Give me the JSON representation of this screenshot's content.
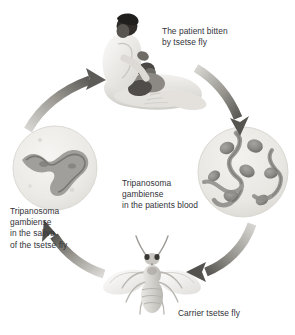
{
  "figure": {
    "background_color": "#ffffff",
    "text_color": "#33343a",
    "cycle_direction": "counter-clockwise"
  },
  "labels": {
    "patient": "The patient bitten\nby tsetse fly",
    "blood": "Tripanosoma\ngambiense\nin the patients blood",
    "saliva": "Tripanosoma\ngambiense\nin the saliva\nof the tsetse fly",
    "fly": "Carrier tsetse fly"
  },
  "nodes": [
    {
      "id": "patient",
      "name": "patient-illustration",
      "description": "Doctor in white coat leaning over a patient lying in bed",
      "position": "top-center"
    },
    {
      "id": "blood-circle",
      "name": "blood-smear-circle",
      "description": "Round microscope field of patient blood with red blood cells and trypanosomes",
      "position": "right",
      "blood_cell_count": 7,
      "circle_fill": "#eceae6",
      "cell_color": "#8a8a8a"
    },
    {
      "id": "fly",
      "name": "tsetse-fly-illustration",
      "description": "Top-down view of a carrier tsetse fly with spread wings",
      "position": "bottom-center"
    },
    {
      "id": "saliva-circle",
      "name": "saliva-smear-circle",
      "description": "Round microscope field of tsetse fly saliva with a single trypanosome",
      "position": "left",
      "parasite_count": 1,
      "circle_fill": "#ededea",
      "parasite_color": "#8e8e8e"
    }
  ],
  "arrows": [
    {
      "id": "arrow-saliva-to-patient",
      "from": "saliva-circle",
      "to": "patient",
      "direction": "up-right"
    },
    {
      "id": "arrow-patient-to-blood",
      "from": "patient",
      "to": "blood-circle",
      "direction": "down-right"
    },
    {
      "id": "arrow-blood-to-fly",
      "from": "blood-circle",
      "to": "fly",
      "direction": "down-left"
    },
    {
      "id": "arrow-fly-to-saliva",
      "from": "fly",
      "to": "saliva-circle",
      "direction": "up-left"
    }
  ]
}
